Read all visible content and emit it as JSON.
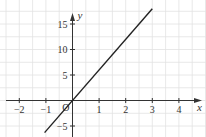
{
  "chart_data": {
    "type": "line",
    "title": "",
    "xlabel": "x",
    "ylabel": "y",
    "xlim": [
      -2.7,
      4.9
    ],
    "ylim": [
      -7,
      19
    ],
    "grid": true,
    "x_ticks": [
      -2,
      -1,
      1,
      2,
      3,
      4
    ],
    "x_tick_labels": [
      "−2",
      "−1",
      "1",
      "2",
      "3",
      "4"
    ],
    "y_ticks": [
      -5,
      5,
      10,
      15
    ],
    "y_tick_labels": [
      "−5",
      "5",
      "10",
      "15"
    ],
    "origin_label": "O",
    "series": [
      {
        "name": "y = 6x",
        "x": [
          -1.05,
          3.0
        ],
        "y": [
          -6.3,
          18.0
        ]
      }
    ]
  },
  "colors": {
    "grid": "#e2e2e2",
    "axis": "#333333",
    "line": "#222222"
  }
}
